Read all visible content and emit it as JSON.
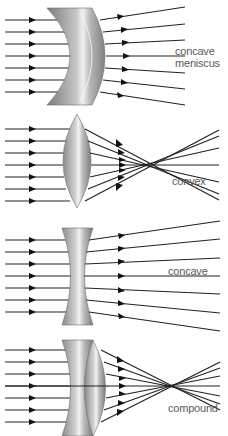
{
  "diagram": {
    "panels": [
      {
        "id": "concave-meniscus",
        "label_line1": "concave",
        "label_line2": "meniscus",
        "behavior": "diverging",
        "rays": 7
      },
      {
        "id": "convex",
        "label_line1": "convex",
        "label_line2": "",
        "behavior": "converging",
        "rays": 7
      },
      {
        "id": "concave",
        "label_line1": "concave",
        "label_line2": "",
        "behavior": "diverging",
        "rays": 7
      },
      {
        "id": "compound",
        "label_line1": "compound",
        "label_line2": "",
        "behavior": "converging",
        "rays": 7
      }
    ],
    "colors": {
      "ray": "#222222",
      "lens_dark": "#8c8c8c",
      "lens_light": "#f2f2f2",
      "label": "#5a5a5a"
    }
  }
}
